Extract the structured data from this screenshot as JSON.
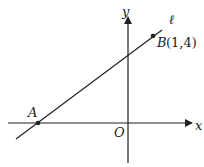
{
  "diagram": {
    "axes": {
      "x_label": "x",
      "y_label": "y",
      "origin_label": "O"
    },
    "line": {
      "label": "ℓ"
    },
    "points": {
      "A": {
        "label": "A"
      },
      "B": {
        "label": "B",
        "coords": "(1,4)"
      }
    },
    "colors": {
      "stroke": "#222222",
      "background": "#ffffff"
    }
  }
}
